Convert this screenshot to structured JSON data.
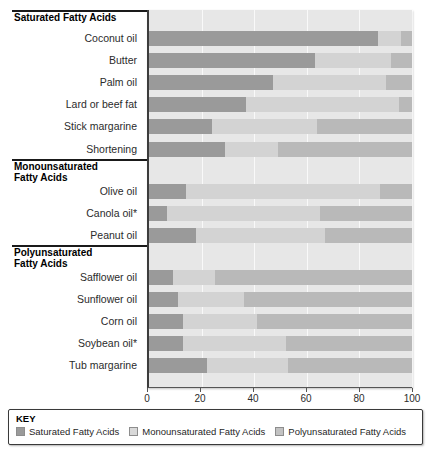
{
  "chart_data": {
    "type": "bar",
    "orientation": "horizontal",
    "stacked": true,
    "title": "",
    "xlabel": "",
    "ylabel": "",
    "xlim": [
      0,
      100
    ],
    "xticks": [
      0,
      20,
      40,
      60,
      80,
      100
    ],
    "grid": true,
    "legend_position": "bottom",
    "series": [
      {
        "name": "Saturated Fatty Acids",
        "key": "sat",
        "color": "#9a9a9a"
      },
      {
        "name": "Monounsaturated Fatty Acids",
        "key": "mono",
        "color": "#d3d3d3"
      },
      {
        "name": "Polyunsaturated Fatty Acids",
        "key": "poly",
        "color": "#b9b9b9"
      }
    ],
    "groups": [
      {
        "header": "Saturated Fatty Acids",
        "header_line1": "Saturated Fatty Acids",
        "header_line2": "",
        "categories": [
          {
            "label": "Coconut oil",
            "sat": 87,
            "mono": 9,
            "poly": 4
          },
          {
            "label": "Butter",
            "sat": 63,
            "mono": 29,
            "poly": 8
          },
          {
            "label": "Palm oil",
            "sat": 47,
            "mono": 43,
            "poly": 10
          },
          {
            "label": "Lard or beef fat",
            "sat": 37,
            "mono": 58,
            "poly": 5
          },
          {
            "label": "Stick margarine",
            "sat": 24,
            "mono": 40,
            "poly": 36
          },
          {
            "label": "Shortening",
            "sat": 29,
            "mono": 20,
            "poly": 51
          }
        ]
      },
      {
        "header": "Monounsaturated Fatty Acids",
        "header_line1": "Monounsaturated",
        "header_line2": "Fatty Acids",
        "categories": [
          {
            "label": "Olive oil",
            "sat": 14,
            "mono": 74,
            "poly": 12
          },
          {
            "label": "Canola oil*",
            "sat": 7,
            "mono": 58,
            "poly": 35
          },
          {
            "label": "Peanut oil",
            "sat": 18,
            "mono": 49,
            "poly": 33
          }
        ]
      },
      {
        "header": "Polyunsaturated Fatty Acids",
        "header_line1": "Polyunsaturated",
        "header_line2": "Fatty Acids",
        "categories": [
          {
            "label": "Safflower oil",
            "sat": 9,
            "mono": 16,
            "poly": 75
          },
          {
            "label": "Sunflower oil",
            "sat": 11,
            "mono": 25,
            "poly": 64
          },
          {
            "label": "Corn oil",
            "sat": 13,
            "mono": 28,
            "poly": 59
          },
          {
            "label": "Soybean oil*",
            "sat": 13,
            "mono": 39,
            "poly": 48
          },
          {
            "label": "Tub margarine",
            "sat": 22,
            "mono": 31,
            "poly": 47
          }
        ]
      }
    ]
  },
  "key": {
    "title": "KEY",
    "items": [
      {
        "label": "Saturated Fatty Acids",
        "swatch": "sat"
      },
      {
        "label": "Monounsaturated Fatty Acids",
        "swatch": "mono"
      },
      {
        "label": "Polyunsaturated Fatty Acids",
        "swatch": "poly"
      }
    ]
  }
}
